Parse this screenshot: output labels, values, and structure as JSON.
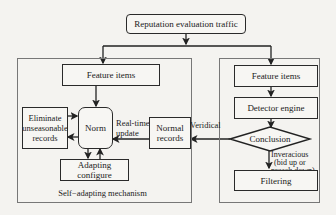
{
  "diagram": {
    "top": {
      "label": "Reputation evaluation traffic"
    },
    "left_panel": {
      "caption": "Self−adapting mechanism",
      "feature_items": "Feature items",
      "norm": "Norm",
      "eliminate": "Eliminate unseasonable records",
      "normal_records": "Normal records",
      "adapting": "Adapting configure",
      "realtime_update": "Real-time update"
    },
    "right_panel": {
      "feature_items": "Feature items",
      "detector": "Detector engine",
      "conclusion": "Conclusion",
      "filtering": "Filtering",
      "inveracious": "Inveracious",
      "inveracious_sub1": "(bid up or",
      "inveracious_sub2": "preach down)"
    },
    "veridical": "Veridical"
  }
}
